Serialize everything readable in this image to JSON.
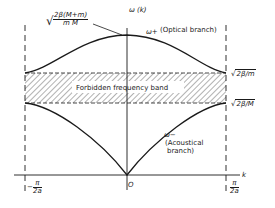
{
  "diagram": {
    "axes": {
      "y_label": "ω (k)",
      "x_label": "k",
      "origin_label": "O",
      "left_boundary": {
        "num": "π",
        "den": "2a",
        "sign": "−"
      },
      "right_boundary": {
        "num": "π",
        "den": "2a",
        "sign": ""
      }
    },
    "branches": {
      "optical": {
        "symbol": "ω+",
        "label": "(Optical branch)"
      },
      "acoustical": {
        "symbol": "ω−",
        "label_line1": "(Acoustical",
        "label_line2": "branch)"
      }
    },
    "band": {
      "label": "Forbidden frequency band"
    },
    "levels": {
      "top": {
        "numerator": "2β(M+m)",
        "denominator": "m M"
      },
      "optical_edge": "2β/m",
      "acoustical_edge": "2β/M"
    },
    "colors": {
      "ink": "#1a1a1a",
      "background": "#ffffff"
    }
  }
}
